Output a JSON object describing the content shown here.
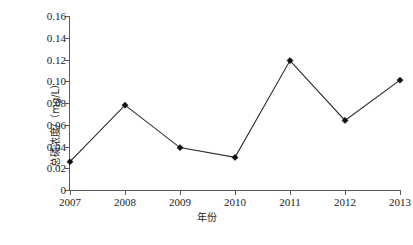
{
  "chart_data": {
    "type": "line",
    "title": "",
    "xlabel": "年份",
    "ylabel": "总磷浓度/（mg/L）",
    "categories": [
      "2007",
      "2008",
      "2009",
      "2010",
      "2011",
      "2012",
      "2013"
    ],
    "values": [
      0.026,
      0.078,
      0.039,
      0.03,
      0.119,
      0.064,
      0.101
    ],
    "series": [
      {
        "name": "总磷浓度",
        "values": [
          0.026,
          0.078,
          0.039,
          0.03,
          0.119,
          0.064,
          0.101
        ]
      }
    ],
    "ylim": [
      0,
      0.16
    ],
    "ytick_values": [
      0,
      0.02,
      0.04,
      0.06,
      0.08,
      0.1,
      0.12,
      0.14,
      0.16
    ],
    "ytick_labels": [
      "0",
      "0.02",
      "0.04",
      "0.06",
      "0.08",
      "0.10",
      "0.12",
      "0.14",
      "0.16"
    ],
    "xtick_labels": [
      "2007",
      "2008",
      "2009",
      "2010",
      "2011",
      "2012",
      "2013"
    ],
    "grid": false,
    "legend": false,
    "legend_position": "none",
    "marker": "diamond",
    "line_color": "#2a2a2a",
    "marker_color": "#111111",
    "axis_color": "#555a5e",
    "background_color": "#ffffff"
  }
}
